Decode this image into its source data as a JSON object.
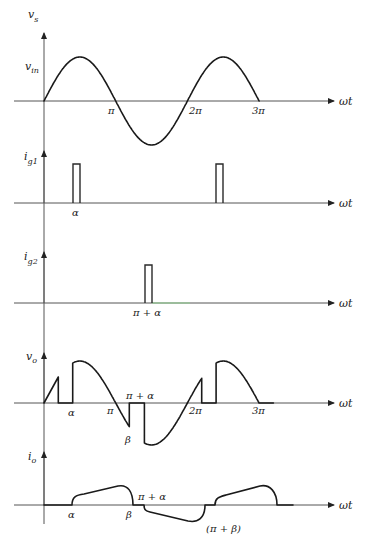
{
  "figure": {
    "type": "waveform-diagram",
    "x_axis_label": "ωt",
    "panels": [
      {
        "id": "vs",
        "y_label_main": "v",
        "y_label_sub": "s",
        "level_label_main": "v",
        "level_label_sub": "in",
        "waveform": "sinusoid",
        "ticks": [
          "π",
          "2π",
          "3π"
        ]
      },
      {
        "id": "ig1",
        "y_label_main": "i",
        "y_label_sub": "g1",
        "waveform": "gate pulses",
        "ticks": [
          "α"
        ]
      },
      {
        "id": "ig2",
        "y_label_main": "i",
        "y_label_sub": "g2",
        "waveform": "gate pulse",
        "ticks": [
          "π + α"
        ]
      },
      {
        "id": "vo",
        "y_label_main": "v",
        "y_label_sub": "o",
        "waveform": "output voltage",
        "ticks": [
          "α",
          "π",
          "π + α",
          "β",
          "2π",
          "3π"
        ]
      },
      {
        "id": "io",
        "y_label_main": "i",
        "y_label_sub": "o",
        "waveform": "output current",
        "ticks": [
          "α",
          "β",
          "π + α",
          "(π + β)"
        ]
      }
    ]
  }
}
